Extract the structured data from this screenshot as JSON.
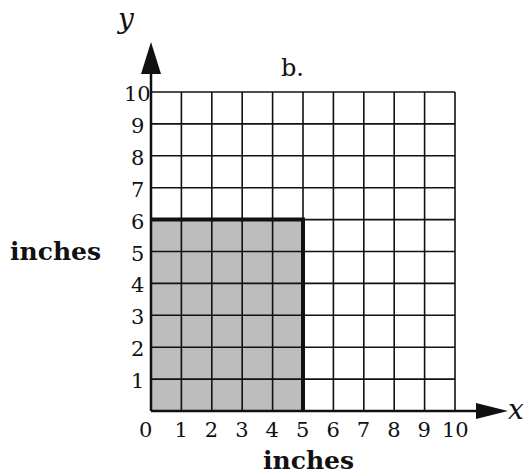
{
  "title": "b.",
  "axes": {
    "x": {
      "var": "x",
      "label": "inches",
      "ticks": [
        "0",
        "1",
        "2",
        "3",
        "4",
        "5",
        "6",
        "7",
        "8",
        "9",
        "10"
      ]
    },
    "y": {
      "var": "y",
      "label": "inches",
      "ticks": [
        "1",
        "2",
        "3",
        "4",
        "5",
        "6",
        "7",
        "8",
        "9",
        "10"
      ]
    }
  },
  "grid": {
    "cols": 10,
    "rows": 10,
    "left": 151,
    "top": 92,
    "right": 455,
    "bottom": 411
  },
  "shaded_rect": {
    "width_units": 5,
    "height_units": 6,
    "fill": "#bdbdbd"
  },
  "colors": {
    "line": "#111111",
    "shade": "#bdbdbd"
  }
}
